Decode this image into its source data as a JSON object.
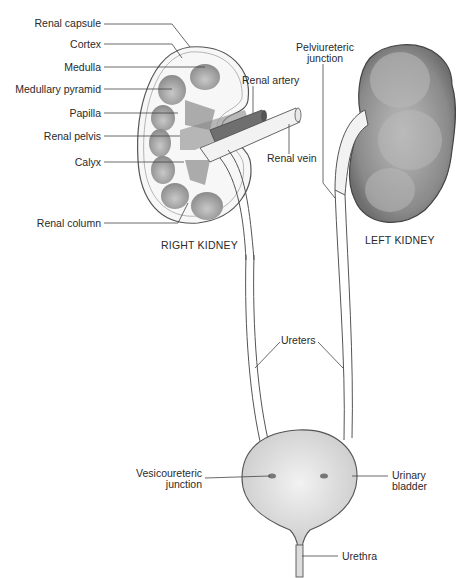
{
  "figure": {
    "type": "anatomical-diagram"
  },
  "labels": {
    "renal_capsule": "Renal capsule",
    "cortex": "Cortex",
    "medulla": "Medulla",
    "medullary_pyramid": "Medullary pyramid",
    "papilla": "Papilla",
    "renal_pelvis": "Renal pelvis",
    "calyx": "Calyx",
    "renal_column": "Renal column",
    "renal_artery": "Renal artery",
    "renal_vein": "Renal vein",
    "pelviureteric_junction_1": "Pelviureteric",
    "pelviureteric_junction_2": "junction",
    "right_kidney": "RIGHT KIDNEY",
    "left_kidney": "LEFT KIDNEY",
    "ureters": "Ureters",
    "vesicoureteric_junction_1": "Vesicoureteric",
    "vesicoureteric_junction_2": "junction",
    "urinary_bladder_1": "Urinary",
    "urinary_bladder_2": "bladder",
    "urethra": "Urethra"
  },
  "colors": {
    "outline": "#555555",
    "pyramid": "#9a9a9a",
    "vessel": "#7a7a7a",
    "left_kidney": "#8f8f8f",
    "bladder": "#dcdcdc"
  }
}
